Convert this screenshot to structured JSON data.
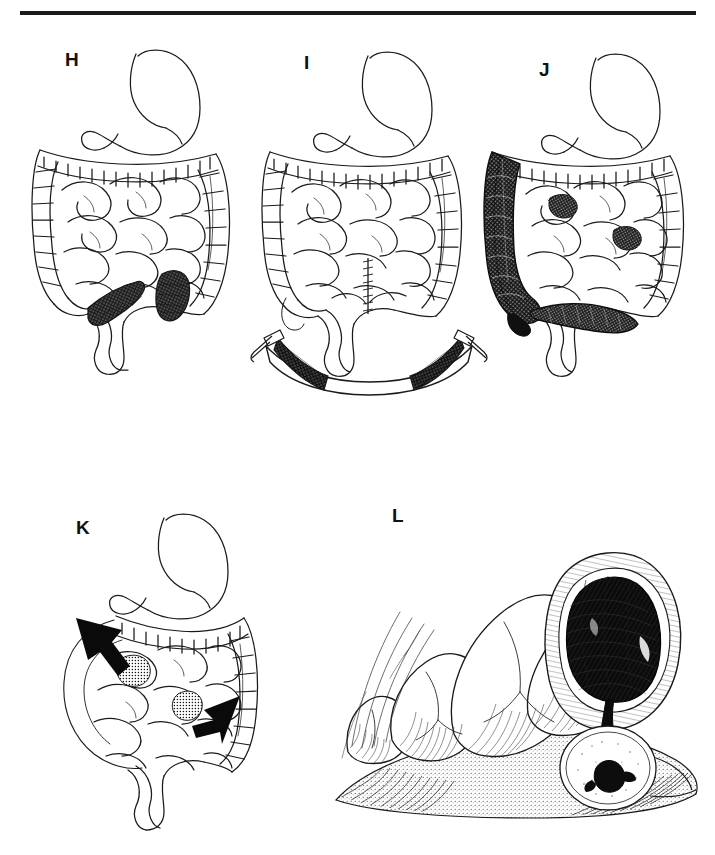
{
  "figure": {
    "kind": "medical-illustration-plate",
    "style": "pen-and-ink line drawing",
    "background_color": "#ffffff",
    "ink_color": "#111111",
    "rule": {
      "present": true,
      "orientation": "horizontal",
      "position": "top"
    },
    "panel_count": 5
  },
  "labels": {
    "h": "H",
    "i": "I",
    "j": "J",
    "k": "K",
    "l": "L"
  },
  "panels": [
    {
      "id": "H",
      "label": "H",
      "view": "anterior abdominal viscera",
      "structures": [
        "stomach",
        "duodenum",
        "transverse colon",
        "ascending colon",
        "descending colon",
        "sigmoid colon",
        "rectum",
        "small bowel loops",
        "cecum"
      ],
      "findings": "two short dark stippled diseased segments of small bowel in the lower mid abdomen",
      "lesion_count": 2,
      "lesion_shading": "dense stipple / cross-hatch",
      "has_specimen": false,
      "has_arrows": false
    },
    {
      "id": "I",
      "label": "I",
      "view": "anterior abdominal viscera after resection",
      "structures": [
        "stomach",
        "duodenum",
        "transverse colon",
        "ascending colon",
        "descending colon",
        "sigmoid colon",
        "rectum",
        "small bowel loops",
        "anastomosis"
      ],
      "findings": "end-to-end small bowel anastomosis with visible suture line; resected specimen displayed below",
      "lesion_count": 0,
      "has_specimen": true,
      "specimen": {
        "description": "resected arc of small bowel held by surgical clamps at each end",
        "clamp_count": 2,
        "diseased_segments": 2,
        "shading": "dense stipple / cross-hatch"
      },
      "has_arrows": false
    },
    {
      "id": "J",
      "label": "J",
      "view": "anterior abdominal viscera",
      "structures": [
        "stomach",
        "duodenum",
        "transverse colon",
        "ascending colon",
        "descending colon",
        "sigmoid colon",
        "rectum",
        "small bowel loops",
        "cecum",
        "terminal ileum"
      ],
      "findings": "extensive dark involvement of ascending colon, cecum and terminal ileum with scattered patchy small bowel lesions",
      "lesion_count": 3,
      "lesion_shading": "heavy cross-hatch / solid black",
      "has_specimen": false,
      "has_arrows": false
    },
    {
      "id": "K",
      "label": "K",
      "view": "anterior abdominal viscera",
      "structures": [
        "stomach",
        "duodenum",
        "transverse colon",
        "ascending colon",
        "descending colon",
        "sigmoid colon",
        "rectum",
        "small bowel loops"
      ],
      "findings": "two small stippled skip lesions of the small bowel indicated by solid black arrowheads",
      "lesion_count": 2,
      "lesion_shading": "fine stipple",
      "has_specimen": false,
      "has_arrows": true,
      "arrows": [
        {
          "id": "arrow-upper-left",
          "direction": "down-right",
          "points_to": "proximal small bowel lesion"
        },
        {
          "id": "arrow-lower-right",
          "direction": "left",
          "points_to": "distal small bowel lesion"
        }
      ]
    },
    {
      "id": "L",
      "label": "L",
      "view": "close-up opened bowel specimen",
      "structures": [
        "mucosal folds",
        "haustra",
        "serosa",
        "mesentery",
        "opened bowel wall",
        "tumour mass",
        "polypoid nodule",
        "stalk"
      ],
      "findings": "large solid heavily shaded intraluminal mass filling an opened bowel segment, connected by a short stalk to a small nodule below; adjacent mucosa thrown into prominent folds",
      "lesion_count": 1,
      "lesion_shading": "solid black with dense cross-hatch",
      "has_specimen": true,
      "has_arrows": false
    }
  ]
}
